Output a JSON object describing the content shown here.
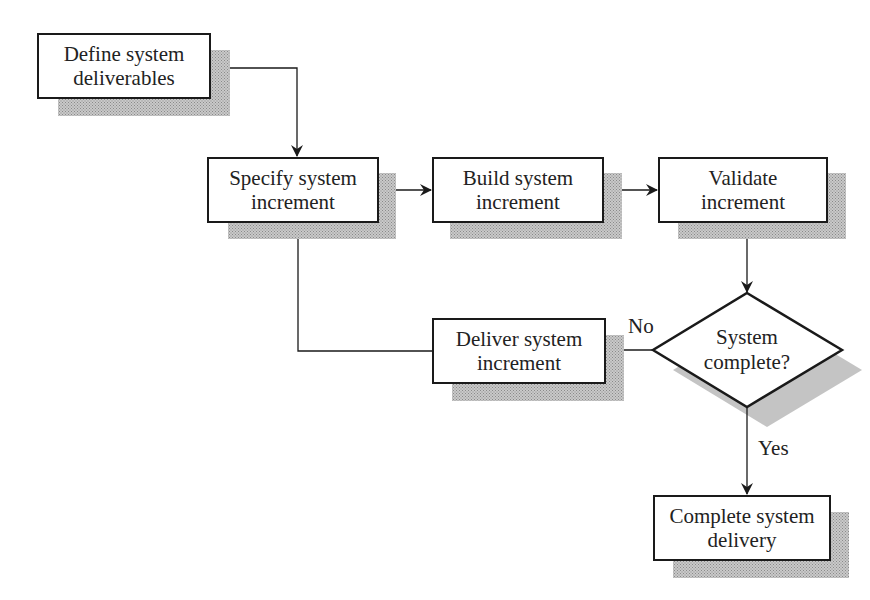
{
  "diagram": {
    "type": "flowchart",
    "title_fragment_visible": false,
    "nodes": [
      {
        "id": "define",
        "kind": "process",
        "line1": "Define system",
        "line2": "deliverables"
      },
      {
        "id": "specify",
        "kind": "process",
        "line1": "Specify system",
        "line2": "increment"
      },
      {
        "id": "build",
        "kind": "process",
        "line1": "Build system",
        "line2": "increment"
      },
      {
        "id": "validate",
        "kind": "process",
        "line1": "Validate",
        "line2": "increment"
      },
      {
        "id": "decision",
        "kind": "decision",
        "line1": "System",
        "line2": "complete?"
      },
      {
        "id": "deliver",
        "kind": "process",
        "line1": "Deliver system",
        "line2": "increment"
      },
      {
        "id": "complete",
        "kind": "process",
        "line1": "Complete system",
        "line2": "delivery"
      }
    ],
    "edges": [
      {
        "from": "define",
        "to": "specify",
        "label": ""
      },
      {
        "from": "specify",
        "to": "build",
        "label": ""
      },
      {
        "from": "build",
        "to": "validate",
        "label": ""
      },
      {
        "from": "validate",
        "to": "decision",
        "label": ""
      },
      {
        "from": "decision",
        "to": "deliver",
        "label": "No"
      },
      {
        "from": "deliver",
        "to": "specify",
        "label": ""
      },
      {
        "from": "decision",
        "to": "complete",
        "label": "Yes"
      }
    ],
    "edge_labels": {
      "no": "No",
      "yes": "Yes"
    },
    "colors": {
      "stroke": "#1a1a1a",
      "shadow": "#b0b0b0",
      "background": "#ffffff"
    }
  }
}
